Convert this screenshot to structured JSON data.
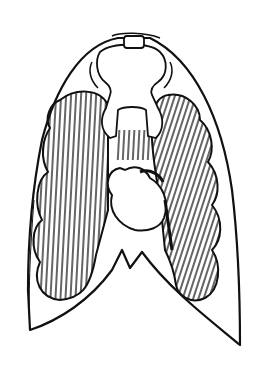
{
  "figure": {
    "colors": {
      "ink": "#111111",
      "paper": "#ffffff"
    }
  }
}
